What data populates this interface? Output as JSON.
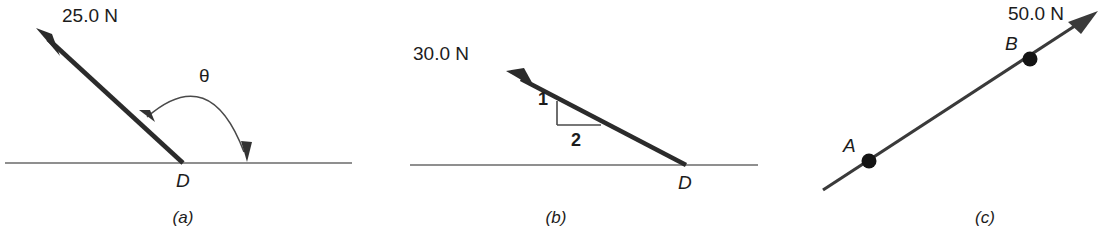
{
  "figure": {
    "type": "physics-force-diagram",
    "panel_count": 3,
    "colors": {
      "vector": "#2b2b2b",
      "ground": "#6a6a6a",
      "arc": "#4a4a4a",
      "text": "#1c1c1c",
      "background": "#ffffff"
    }
  },
  "panels": [
    {
      "id": "a",
      "caption": "(a)",
      "force_label": "25.0 N",
      "angle_label": "θ",
      "point_label": "D",
      "vector": {
        "tail_x": 183,
        "tail_y": 163,
        "tip_x": 36,
        "tip_y": 28,
        "direction": "up-left"
      },
      "ground": {
        "x1": 5,
        "x2": 352,
        "y": 163
      },
      "arc": {
        "from_x": 141,
        "from_y": 112,
        "to_x": 248,
        "to_y": 160,
        "double_headed": true
      },
      "force_label_pos": {
        "x": 62,
        "y": 22
      },
      "angle_label_pos": {
        "x": 199,
        "y": 82
      },
      "point_label_pos": {
        "x": 176,
        "y": 187
      },
      "caption_pos": {
        "x": 183,
        "y": 223
      }
    },
    {
      "id": "b",
      "caption": "(b)",
      "force_label": "30.0 N",
      "point_label": "D",
      "slope_rise_label": "1",
      "slope_run_label": "2",
      "slope_ratio": "1:2",
      "vector": {
        "tail_x": 686,
        "tail_y": 165,
        "tip_x": 506,
        "tip_y": 71,
        "direction": "up-left"
      },
      "ground": {
        "x1": 410,
        "x2": 758,
        "y": 165
      },
      "slope_triangle": {
        "corner_x": 557,
        "corner_y": 125,
        "top_x": 557,
        "top_y": 101,
        "right_x": 600,
        "right_y": 125
      },
      "force_label_pos": {
        "x": 413,
        "y": 60
      },
      "slope_rise_label_pos": {
        "x": 538,
        "y": 105
      },
      "slope_run_label_pos": {
        "x": 571,
        "y": 146
      },
      "point_label_pos": {
        "x": 678,
        "y": 189
      },
      "caption_pos": {
        "x": 556,
        "y": 223
      }
    },
    {
      "id": "c",
      "caption": "(c)",
      "force_label": "50.0 N",
      "point_a_label": "A",
      "point_b_label": "B",
      "vector": {
        "tail_x": 823,
        "tail_y": 190,
        "tip_x": 1098,
        "tip_y": 11,
        "direction": "up-right"
      },
      "point_a": {
        "x": 869,
        "y": 161
      },
      "point_b": {
        "x": 1030,
        "y": 59
      },
      "force_label_pos": {
        "x": 1008,
        "y": 5
      },
      "point_a_label_pos": {
        "x": 843,
        "y": 138
      },
      "point_b_label_pos": {
        "x": 1003,
        "y": 36
      },
      "caption_pos": {
        "x": 985,
        "y": 223
      }
    }
  ]
}
